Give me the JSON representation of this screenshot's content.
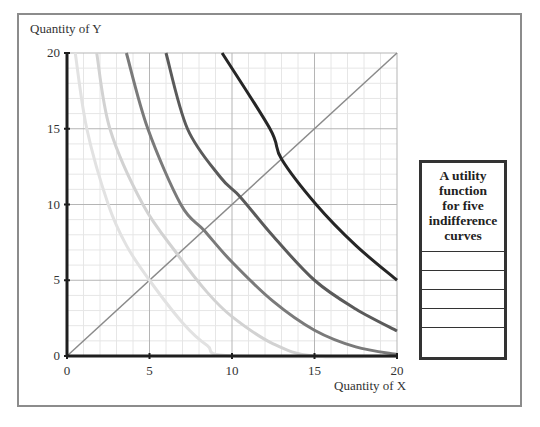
{
  "chart_data": {
    "type": "line",
    "title": "",
    "xlabel": "Quantity of X",
    "ylabel": "Quantity of Y",
    "xlim": [
      0,
      20
    ],
    "ylim": [
      0,
      20
    ],
    "x_ticks": [
      0,
      5,
      10,
      15,
      20
    ],
    "y_ticks": [
      0,
      5,
      10,
      15,
      20
    ],
    "grid": true,
    "minor_grid": true,
    "legend": {
      "title": "A utility function for five indifference curves",
      "position": "right",
      "entries": [
        "",
        "",
        "",
        "",
        ""
      ]
    },
    "reference_line": {
      "name": "45-degree ray",
      "points": [
        [
          0,
          0
        ],
        [
          20,
          20
        ]
      ],
      "color": "#8a8a8a"
    },
    "series": [
      {
        "name": "Indifference curve 1",
        "color": "#e2e2e2",
        "points": [
          [
            0.5,
            20
          ],
          [
            1.2,
            15
          ],
          [
            2.5,
            10
          ],
          [
            3.6,
            7.3
          ],
          [
            5,
            5
          ],
          [
            7,
            2.2
          ],
          [
            8.5,
            0.7
          ],
          [
            10,
            0
          ],
          [
            20,
            0
          ]
        ]
      },
      {
        "name": "Indifference curve 2",
        "color": "#d2d2d2",
        "points": [
          [
            1.8,
            20
          ],
          [
            2.6,
            15
          ],
          [
            4.6,
            10
          ],
          [
            6.7,
            6.7
          ],
          [
            8.5,
            4.2
          ],
          [
            10,
            2.6
          ],
          [
            12.5,
            0.8
          ],
          [
            15,
            0
          ],
          [
            20,
            0
          ]
        ]
      },
      {
        "name": "Indifference curve 3",
        "color": "#7a7a7a",
        "points": [
          [
            3.6,
            20
          ],
          [
            4.9,
            15
          ],
          [
            6.9,
            10
          ],
          [
            8.3,
            8.3
          ],
          [
            10,
            6.2
          ],
          [
            12.5,
            3.6
          ],
          [
            15,
            1.7
          ],
          [
            17.5,
            0.6
          ],
          [
            20,
            0.1
          ]
        ]
      },
      {
        "name": "Indifference curve 4",
        "color": "#5a5a5a",
        "points": [
          [
            6.0,
            20
          ],
          [
            7.3,
            15
          ],
          [
            9.3,
            11.8
          ],
          [
            10.5,
            10.5
          ],
          [
            12.5,
            7.9
          ],
          [
            15,
            5.0
          ],
          [
            17.5,
            3.1
          ],
          [
            20,
            1.65
          ]
        ]
      },
      {
        "name": "Indifference curve 5",
        "color": "#262626",
        "points": [
          [
            9.4,
            20
          ],
          [
            12.3,
            15
          ],
          [
            13.0,
            13.0
          ],
          [
            15.1,
            10
          ],
          [
            17.5,
            7.3
          ],
          [
            20,
            5.0
          ]
        ]
      }
    ]
  },
  "labels": {
    "y_axis": "Quantity of Y",
    "x_axis": "Quantity of X",
    "legend_title_lines": [
      "A utility",
      "function",
      "for five",
      "indifference",
      "curves"
    ]
  }
}
